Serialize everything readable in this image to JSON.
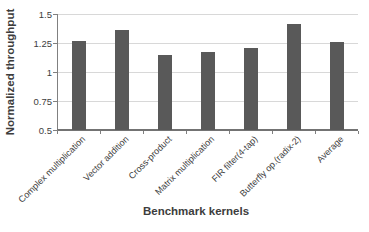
{
  "figure": {
    "background": "#ffffff"
  },
  "chart_data": {
    "type": "bar",
    "title": "",
    "categories": [
      "Complex multiplication",
      "Vector addition",
      "Cross-product",
      "Matrix multiplication",
      "FIR filter(4-tap)",
      "Butterfly op.(radix-2)",
      "Average"
    ],
    "values": [
      1.27,
      1.36,
      1.15,
      1.17,
      1.21,
      1.41,
      1.26
    ],
    "xlabel": "Benchmark kernels",
    "ylabel": "Normalized throughput",
    "ylim": [
      0.5,
      1.5
    ],
    "yticks": [
      0.5,
      0.75,
      1,
      1.25,
      1.5
    ],
    "ytick_labels": [
      "0.5",
      "0.75",
      "1",
      "1.25",
      "1.5"
    ],
    "grid": true,
    "legend": false,
    "bar_color": "#595959",
    "gridline_color": "#d8d8d8",
    "axis_color": "#808080",
    "baseline_color": "#737373",
    "text_color": "#3d3d3d"
  }
}
